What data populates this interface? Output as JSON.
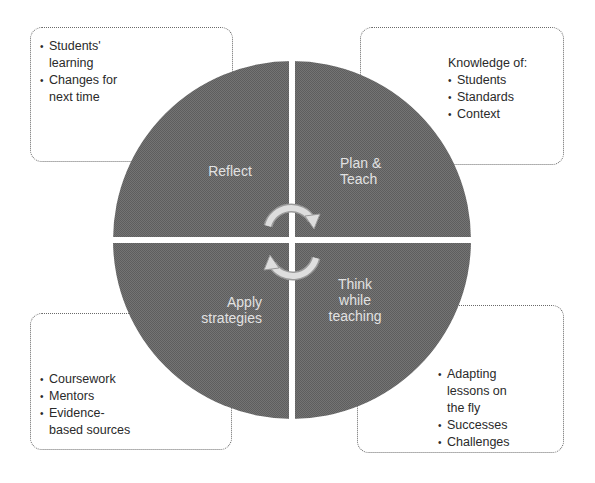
{
  "colors": {
    "quadrant_fill": "#6e6e6e",
    "quadrant_text": "#e2e2e2",
    "arrow_fill": "#d9d9d9",
    "box_border": "#6a6a6a",
    "box_text": "#2a2a2a",
    "background": "#ffffff"
  },
  "cycle": {
    "quadrants": [
      {
        "position": "top-left",
        "label": "Reflect"
      },
      {
        "position": "top-right",
        "label_lines": [
          "Plan &",
          "Teach"
        ]
      },
      {
        "position": "bottom-right",
        "label_lines": [
          "Think",
          "while",
          "teaching"
        ]
      },
      {
        "position": "bottom-left",
        "label_lines": [
          "Apply",
          "strategies"
        ]
      }
    ],
    "center_icons": [
      "cycle-arrow-clockwise-top",
      "cycle-arrow-clockwise-bottom"
    ]
  },
  "boxes": {
    "top_left": {
      "items": [
        [
          "Students'",
          "learning"
        ],
        [
          "Changes for",
          "next time"
        ]
      ]
    },
    "top_right": {
      "title": "Knowledge of:",
      "items": [
        "Students",
        "Standards",
        "Context"
      ]
    },
    "bottom_left": {
      "items": [
        [
          "Coursework"
        ],
        [
          "Mentors"
        ],
        [
          "Evidence-",
          "based sources"
        ]
      ]
    },
    "bottom_right": {
      "items": [
        [
          "Adapting",
          "lessons on",
          "the fly"
        ],
        [
          "Successes"
        ],
        [
          "Challenges"
        ]
      ]
    }
  }
}
